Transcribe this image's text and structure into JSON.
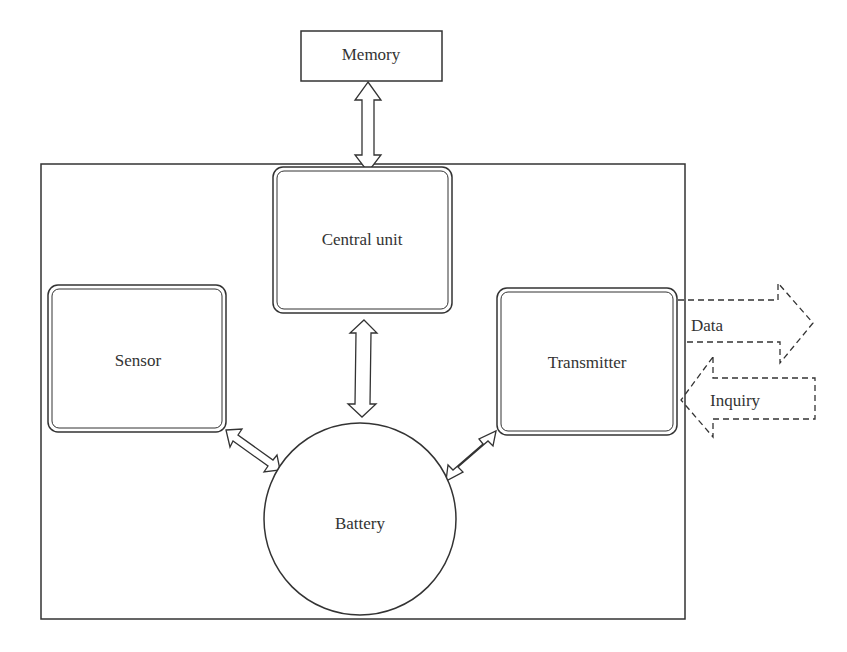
{
  "diagram": {
    "title": "",
    "nodes": {
      "memory": {
        "label": "Memory"
      },
      "central_unit": {
        "label": "Central unit"
      },
      "sensor": {
        "label": "Sensor"
      },
      "transmitter": {
        "label": "Transmitter"
      },
      "battery": {
        "label": "Battery"
      }
    },
    "external_arrows": {
      "data": {
        "label": "Data",
        "direction": "out"
      },
      "inquiry": {
        "label": "Inquiry",
        "direction": "in"
      }
    },
    "edges": [
      {
        "from": "memory",
        "to": "central_unit",
        "type": "bidirectional"
      },
      {
        "from": "central_unit",
        "to": "battery",
        "type": "bidirectional"
      },
      {
        "from": "sensor",
        "to": "battery",
        "type": "bidirectional"
      },
      {
        "from": "transmitter",
        "to": "battery",
        "type": "bidirectional"
      }
    ],
    "colors": {
      "stroke": "#333333",
      "background": "#ffffff"
    }
  }
}
